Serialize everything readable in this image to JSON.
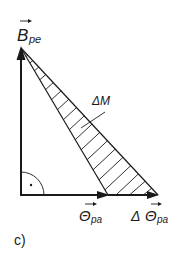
{
  "figure": {
    "panel_label": "c)",
    "labels": {
      "vertical_vector": {
        "main": "B",
        "sub": "pe"
      },
      "horizontal_vector": {
        "main": "Θ",
        "sub": "pa"
      },
      "delta_vector": {
        "prefix": "Δ",
        "main": "Θ",
        "sub": "pa"
      },
      "hatched_area": "ΔM"
    },
    "colors": {
      "stroke": "#1a1a1a",
      "background": "#ffffff"
    }
  }
}
